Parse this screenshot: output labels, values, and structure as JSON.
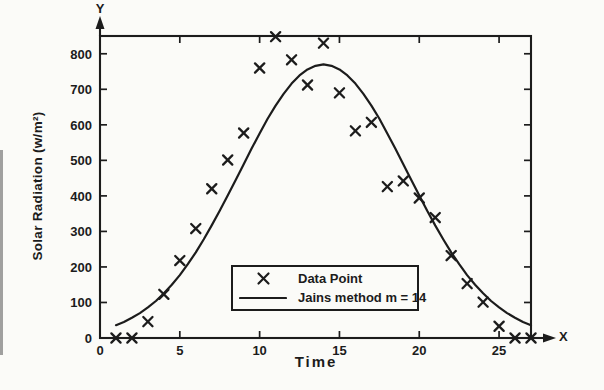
{
  "figure": {
    "background": "#fbfbf8",
    "ink": "#1c1c1c"
  },
  "chart_data": {
    "type": "scatter",
    "title": "",
    "xlabel": "Time",
    "ylabel": "Solar Radiation (w/m²)",
    "x_axis_arrow_label": "X",
    "y_axis_arrow_label": "Y",
    "xlim": [
      0,
      27
    ],
    "ylim": [
      0,
      850
    ],
    "x_ticks": [
      0,
      5,
      10,
      15,
      20,
      25
    ],
    "y_ticks": [
      0,
      100,
      200,
      300,
      400,
      500,
      600,
      700,
      800
    ],
    "grid": false,
    "legend": {
      "position": "inside-bottom-center",
      "entries": [
        {
          "label": "Data Point",
          "marker": "x"
        },
        {
          "label": "Jains method m = 14",
          "marker": "line"
        }
      ]
    },
    "series": [
      {
        "name": "Data Point",
        "type": "scatter",
        "marker": "x",
        "x": [
          1,
          2,
          3,
          4,
          5,
          6,
          7,
          8,
          9,
          10,
          11,
          12,
          13,
          14,
          15,
          16,
          17,
          18,
          19,
          20,
          21,
          22,
          23,
          24,
          25,
          26,
          27
        ],
        "y": [
          0,
          0,
          46,
          123,
          218,
          308,
          420,
          501,
          577,
          760,
          848,
          783,
          712,
          830,
          690,
          583,
          607,
          426,
          442,
          394,
          339,
          232,
          153,
          101,
          33,
          0,
          0
        ]
      },
      {
        "name": "Jains method m = 14",
        "type": "line",
        "x": [
          1,
          1.5,
          2,
          2.5,
          3,
          3.5,
          4,
          4.5,
          5,
          5.5,
          6,
          6.5,
          7,
          7.5,
          8,
          8.5,
          9,
          9.5,
          10,
          10.5,
          11,
          11.5,
          12,
          12.5,
          13,
          13.5,
          14,
          14.5,
          15,
          15.5,
          16,
          16.5,
          17,
          17.5,
          18,
          18.5,
          19,
          19.5,
          20,
          20.5,
          21,
          21.5,
          22,
          22.5,
          23,
          23.5,
          24,
          24.5,
          25,
          25.5,
          26,
          26.5,
          27
        ],
        "y": [
          36,
          45,
          57,
          70,
          86,
          104,
          126,
          150,
          177,
          208,
          241,
          278,
          317,
          358,
          401,
          445,
          489,
          533,
          576,
          617,
          654,
          687,
          716,
          739,
          756,
          766,
          770,
          766,
          756,
          739,
          716,
          687,
          654,
          617,
          576,
          533,
          489,
          445,
          401,
          358,
          317,
          278,
          241,
          208,
          177,
          150,
          126,
          104,
          86,
          70,
          57,
          45,
          36
        ]
      }
    ]
  }
}
